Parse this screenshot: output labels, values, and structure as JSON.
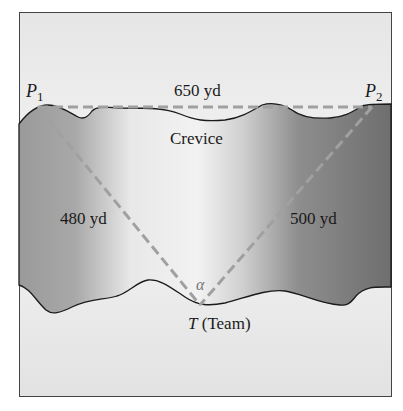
{
  "diagram": {
    "type": "crevice-triangle",
    "points": {
      "p1": {
        "label": "P",
        "subscript": "1"
      },
      "p2": {
        "label": "P",
        "subscript": "2"
      },
      "t": {
        "label": "T",
        "suffix": "(Team)"
      }
    },
    "distances": {
      "p1_p2": "650 yd",
      "p1_t": "480 yd",
      "p2_t": "500 yd"
    },
    "region_label": "Crevice",
    "angle_label": "α",
    "colors": {
      "dashed_line": "#a0a0a0",
      "outline": "#1a1a1a",
      "background_light": "#eeeeee",
      "crevice_dark": "#7a7a7a",
      "crevice_light": "#f2f2f2"
    }
  }
}
